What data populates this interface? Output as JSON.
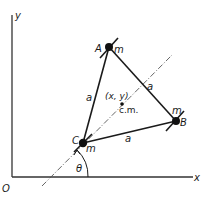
{
  "diagram": {
    "axes": {
      "x_label": "x",
      "y_label": "y",
      "origin_label": "O"
    },
    "masses": [
      {
        "id": "A",
        "label": "A",
        "mass_label": "m"
      },
      {
        "id": "B",
        "label": "B",
        "mass_label": "m"
      },
      {
        "id": "C",
        "label": "C",
        "mass_label": "m"
      }
    ],
    "edges": [
      {
        "from": "C",
        "to": "A",
        "label": "a"
      },
      {
        "from": "A",
        "to": "B",
        "label": "a"
      },
      {
        "from": "C",
        "to": "B",
        "label": "a"
      }
    ],
    "center_of_mass": {
      "coord_label": "(x, y)",
      "label": "c.m."
    },
    "angle_label": "θ",
    "colors": {
      "ink": "#1a1a1a",
      "dashline": "#555555",
      "background": "#ffffff"
    }
  }
}
